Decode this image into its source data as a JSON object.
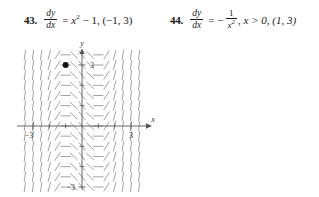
{
  "problems": [
    {
      "number": "43.",
      "lhs_top": "dy",
      "lhs_bot": "dx",
      "equals": "=",
      "rhs": "x",
      "rhs_exp": "2",
      "rhs_rest": " − 1, (−1, 3)",
      "graph": {
        "x_axis_label": "x",
        "y_axis_label": "y",
        "x_ticks": [
          "−3",
          "3"
        ],
        "y_ticks": [
          "3",
          "−3"
        ],
        "point_label": "3",
        "point": [
          -1,
          3
        ],
        "xlim": [
          -4,
          4
        ],
        "ylim": [
          -4,
          4
        ]
      }
    },
    {
      "number": "44.",
      "lhs_top": "dy",
      "lhs_bot": "dx",
      "equals": "=",
      "rhs_sign": "−",
      "rhs_num": "1",
      "rhs_den": "x",
      "rhs_den_exp": "2",
      "rhs_rest": ", x > 0, (1, 3)",
      "graph": {
        "x_axis_label": "x",
        "y_axis_label": "y",
        "x_ticks": [
          "7"
        ],
        "y_ticks": [
          "4",
          "3",
          "2",
          "1",
          "−1",
          "−2",
          "−3",
          "−4"
        ],
        "point": [
          1,
          3
        ],
        "xlim": [
          -1,
          8
        ],
        "ylim": [
          -4.6,
          4.6
        ]
      }
    }
  ],
  "chart_data": [
    {
      "type": "scatter",
      "title": "Slope field for dy/dx = x^2 - 1 with point (-1, 3)",
      "xlabel": "x",
      "ylabel": "y",
      "xlim": [
        -4,
        4
      ],
      "ylim": [
        -4,
        4
      ],
      "xticks": [
        -3,
        3
      ],
      "yticks": [
        3,
        -3
      ],
      "grid": false,
      "points": [
        {
          "x": -1,
          "y": 3,
          "label": "3"
        }
      ],
      "slope_expression": "x^2 - 1",
      "field_note": "Short line segments of slope x^2-1 drawn on a grid; slope is zero at x = ±1, steep positive outside |x|>1, negative between."
    },
    {
      "type": "scatter",
      "title": "Slope field for dy/dx = -1/x^2, x > 0, with point (1, 3)",
      "xlabel": "x",
      "ylabel": "y",
      "xlim": [
        -1,
        8
      ],
      "ylim": [
        -4.6,
        4.6
      ],
      "xticks": [
        7
      ],
      "yticks": [
        4,
        3,
        2,
        1,
        -1,
        -2,
        -3,
        -4
      ],
      "grid": false,
      "points": [
        {
          "x": 1,
          "y": 3
        }
      ],
      "slope_expression": "-1/x^2",
      "field_note": "Short line segments of slope -1/x^2 for x>0; very steep negative near x=0, flattening to nearly horizontal as x increases."
    }
  ]
}
